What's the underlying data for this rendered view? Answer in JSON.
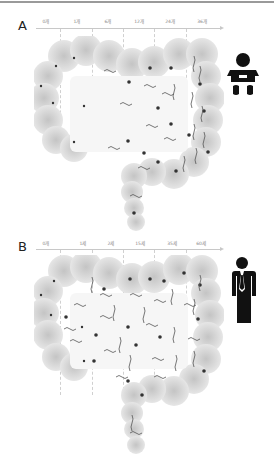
{
  "figure": {
    "panels": [
      {
        "letter": "A",
        "stage": "infant",
        "icon": "baby-icon",
        "timepoints": [
          "0개",
          "1개",
          "6개",
          "12개",
          "24개",
          "36개"
        ]
      },
      {
        "letter": "B",
        "stage": "adult",
        "icon": "adult-man-icon",
        "timepoints": [
          "0개",
          "1세",
          "2세",
          "15세",
          "35세",
          "60세"
        ]
      }
    ],
    "colors": {
      "gut_fill": "#d9d9d9",
      "lumen": "#f7f7f7",
      "microbe": "#555555",
      "icon": "#111111"
    }
  }
}
